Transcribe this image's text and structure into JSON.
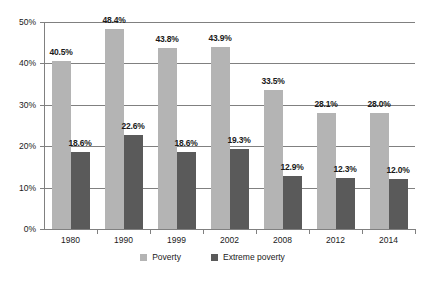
{
  "chart_data": {
    "type": "bar",
    "title": "",
    "subtitle": "",
    "xlabel": "",
    "ylabel": "",
    "categories": [
      "1980",
      "1990",
      "1999",
      "2002",
      "2008",
      "2012",
      "2014"
    ],
    "series": [
      {
        "name": "Poverty",
        "color": "#b4b4b4",
        "values": [
          40.5,
          48.4,
          43.8,
          43.9,
          33.5,
          28.1,
          28.0
        ],
        "labels": [
          "40.5%",
          "48.4%",
          "43.8%",
          "43.9%",
          "33.5%",
          "28.1%",
          "28.0%"
        ]
      },
      {
        "name": "Extreme poverty",
        "color": "#5a5a5a",
        "values": [
          18.6,
          22.6,
          18.6,
          19.3,
          12.9,
          12.3,
          12.0
        ],
        "labels": [
          "18.6%",
          "22.6%",
          "18.6%",
          "19.3%",
          "12.9%",
          "12.3%",
          "12.0%"
        ]
      }
    ],
    "ylim": [
      0,
      50
    ],
    "ytick_values": [
      0,
      10,
      20,
      30,
      40,
      50
    ],
    "ytick_labels": [
      "0%",
      "10%",
      "20%",
      "30%",
      "40%",
      "50%"
    ],
    "grid": true,
    "legend_position": "bottom",
    "background": "#ffffff",
    "axis_color": "#808080"
  },
  "legend": {
    "items": [
      {
        "label": "Poverty"
      },
      {
        "label": "Extreme poverty"
      }
    ]
  }
}
